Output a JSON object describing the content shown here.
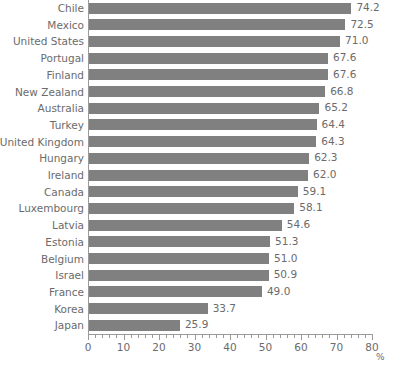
{
  "chart_data": {
    "type": "bar",
    "orientation": "horizontal",
    "title": "",
    "subtitle": "",
    "xlabel": "%",
    "ylabel": "",
    "xlim": [
      0,
      80
    ],
    "xticks": [
      0,
      10,
      20,
      30,
      40,
      50,
      60,
      70,
      80
    ],
    "xtick_labels": [
      "0",
      "10",
      "20",
      "30",
      "40",
      "50",
      "60",
      "70",
      "80"
    ],
    "minor_tick_step": 2,
    "grid": false,
    "legend": false,
    "bar_color": "#808080",
    "text_color": "#6b6b6b",
    "axis_color": "#9a9a9a",
    "value_label_format": "one-decimal",
    "categories": [
      "Chile",
      "Mexico",
      "United States",
      "Portugal",
      "Finland",
      "New Zealand",
      "Australia",
      "Turkey",
      "United Kingdom",
      "Hungary",
      "Ireland",
      "Canada",
      "Luxembourg",
      "Latvia",
      "Estonia",
      "Belgium",
      "Israel",
      "France",
      "Korea",
      "Japan"
    ],
    "values": [
      74.2,
      72.5,
      71.0,
      67.6,
      67.6,
      66.8,
      65.2,
      64.4,
      64.3,
      62.3,
      62.0,
      59.1,
      58.1,
      54.6,
      51.3,
      51.0,
      50.9,
      49.0,
      33.7,
      25.9
    ],
    "value_labels": [
      "74.2",
      "72.5",
      "71.0",
      "67.6",
      "67.6",
      "66.8",
      "65.2",
      "64.4",
      "64.3",
      "62.3",
      "62.0",
      "59.1",
      "58.1",
      "54.6",
      "51.3",
      "51.0",
      "50.9",
      "49.0",
      "33.7",
      "25.9"
    ]
  }
}
